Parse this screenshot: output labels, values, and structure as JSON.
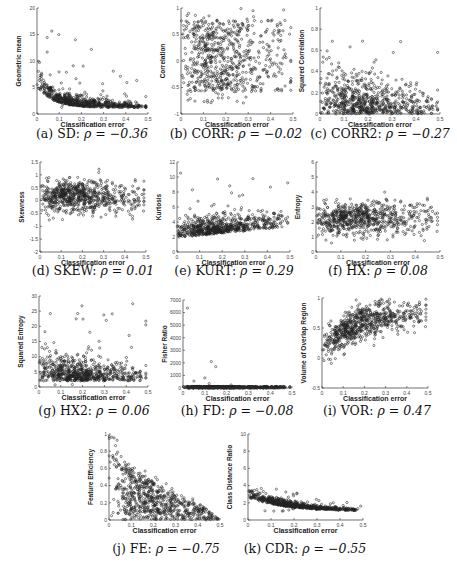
{
  "figure": {
    "panels_count": 11
  },
  "chart_data": [
    {
      "id": "a",
      "type": "scatter",
      "caption_label": "(a) SD:",
      "rho_text": "ρ = −0.36",
      "xlabel": "Classification error",
      "ylabel": "Geometric mean",
      "xlim": [
        0,
        0.5
      ],
      "ylim": [
        0,
        20
      ],
      "xticks": [
        0,
        0.1,
        0.2,
        0.3,
        0.4,
        0.5
      ],
      "xtick_labels": [
        "0",
        "0.1",
        "0.2",
        "0.3",
        "0.4",
        "0.5"
      ],
      "yticks": [
        0,
        5,
        10,
        15,
        20
      ],
      "ytick_labels": [
        "0",
        "5",
        "10",
        "15",
        "20"
      ],
      "pattern": "decay",
      "params": {
        "base": 1.2,
        "amp": 4.0,
        "rate": 14,
        "noise": 1.6,
        "outlier_max": 19
      },
      "box": {
        "left": 37,
        "top": 8,
        "w": 111,
        "h": 106
      },
      "caption_pos": {
        "x": 92,
        "y": 126
      }
    },
    {
      "id": "b",
      "type": "scatter",
      "caption_label": "(b) CORR:",
      "rho_text": "ρ = −0.02",
      "xlabel": "Classification error",
      "ylabel": "Correlation",
      "xlim": [
        0,
        0.5
      ],
      "ylim": [
        -1,
        1
      ],
      "xticks": [
        0,
        0.1,
        0.2,
        0.3,
        0.4,
        0.5
      ],
      "xtick_labels": [
        "0",
        "0.1",
        "0.2",
        "0.3",
        "0.4",
        "0.5"
      ],
      "yticks": [
        -1,
        -0.5,
        0,
        0.5,
        1
      ],
      "ytick_labels": [
        "-1",
        "-0.5",
        "0",
        "0.5",
        "1"
      ],
      "pattern": "uniform_band",
      "params": {
        "center": 0.1,
        "spread": 0.85
      },
      "box": {
        "left": 181,
        "top": 8,
        "w": 112,
        "h": 106
      },
      "caption_pos": {
        "x": 236,
        "y": 126
      }
    },
    {
      "id": "c",
      "type": "scatter",
      "caption_label": "(c) CORR2:",
      "rho_text": "ρ = −0.27",
      "xlabel": "Classification error",
      "ylabel": "Squared Correlation",
      "xlim": [
        0,
        0.5
      ],
      "ylim": [
        0,
        1
      ],
      "xticks": [
        0,
        0.1,
        0.2,
        0.3,
        0.4,
        0.5
      ],
      "xtick_labels": [
        "0",
        "0.1",
        "0.2",
        "0.3",
        "0.4",
        "0.5"
      ],
      "yticks": [
        0,
        0.2,
        0.4,
        0.6,
        0.8,
        1
      ],
      "ytick_labels": [
        "0",
        "0.2",
        "0.4",
        "0.6",
        "0.8",
        "1"
      ],
      "pattern": "floor_skew",
      "params": {
        "scale": 0.22,
        "decay": 1.6,
        "max": 0.85
      },
      "box": {
        "left": 320,
        "top": 8,
        "w": 120,
        "h": 106
      },
      "caption_pos": {
        "x": 380,
        "y": 126
      }
    },
    {
      "id": "d",
      "type": "scatter",
      "caption_label": "(d) SKEW:",
      "rho_text": "ρ = 0.01",
      "xlabel": "Classification error",
      "ylabel": "Skewness",
      "xlim": [
        0,
        0.5
      ],
      "ylim": [
        -2,
        1.5
      ],
      "xticks": [
        0,
        0.1,
        0.2,
        0.3,
        0.4,
        0.5
      ],
      "xtick_labels": [
        "0",
        "0.1",
        "0.2",
        "0.3",
        "0.4",
        "0.5"
      ],
      "yticks": [
        -2,
        -1.5,
        -1,
        -0.5,
        0,
        0.5,
        1,
        1.5
      ],
      "ytick_labels": [
        "-2",
        "-1.5",
        "-1",
        "-0.5",
        "0",
        "0.5",
        "1",
        "1.5"
      ],
      "pattern": "gauss_band",
      "params": {
        "center": 0.15,
        "sd": 0.3
      },
      "box": {
        "left": 40,
        "top": 162,
        "w": 106,
        "h": 90
      },
      "caption_pos": {
        "x": 93,
        "y": 263
      }
    },
    {
      "id": "e",
      "type": "scatter",
      "caption_label": "(e) KURT:",
      "rho_text": "ρ = 0.29",
      "xlabel": "Classification error",
      "ylabel": "Kurtosis",
      "xlim": [
        0,
        0.5
      ],
      "ylim": [
        0,
        12
      ],
      "xticks": [
        0,
        0.1,
        0.2,
        0.3,
        0.4,
        0.5
      ],
      "xtick_labels": [
        "0",
        "0.1",
        "0.2",
        "0.3",
        "0.4",
        "0.5"
      ],
      "yticks": [
        0,
        2,
        4,
        6,
        8,
        10,
        12
      ],
      "ytick_labels": [
        "0",
        "2",
        "4",
        "6",
        "8",
        "10",
        "12"
      ],
      "pattern": "rising_floor",
      "params": {
        "base": 2.2,
        "slope": 3.0,
        "sd": 0.7,
        "outlier_max": 10.7
      },
      "box": {
        "left": 177,
        "top": 162,
        "w": 113,
        "h": 90
      },
      "caption_pos": {
        "x": 234,
        "y": 263
      }
    },
    {
      "id": "f",
      "type": "scatter",
      "caption_label": "(f) HX:",
      "rho_text": "ρ = 0.08",
      "xlabel": "Classification error",
      "ylabel": "Entropy",
      "xlim": [
        0,
        0.5
      ],
      "ylim": [
        0,
        6
      ],
      "xticks": [
        0,
        0.1,
        0.2,
        0.3,
        0.4,
        0.5
      ],
      "xtick_labels": [
        "0",
        "0.1",
        "0.2",
        "0.3",
        "0.4",
        "0.5"
      ],
      "yticks": [
        0,
        1,
        2,
        3,
        4,
        5,
        6
      ],
      "ytick_labels": [
        "0",
        "1",
        "2",
        "3",
        "4",
        "5",
        "6"
      ],
      "pattern": "gauss_band",
      "params": {
        "center": 2.1,
        "sd": 0.55,
        "slope": 0.6
      },
      "box": {
        "left": 316,
        "top": 162,
        "w": 124,
        "h": 90
      },
      "caption_pos": {
        "x": 378,
        "y": 263
      }
    },
    {
      "id": "g",
      "type": "scatter",
      "caption_label": "(g) HX2:",
      "rho_text": "ρ = 0.06",
      "xlabel": "Classification error",
      "ylabel": "Squared Entropy",
      "xlim": [
        0,
        0.5
      ],
      "ylim": [
        0,
        30
      ],
      "xticks": [
        0,
        0.1,
        0.2,
        0.3,
        0.4,
        0.5
      ],
      "xtick_labels": [
        "0",
        "0.1",
        "0.2",
        "0.3",
        "0.4",
        "0.5"
      ],
      "yticks": [
        0,
        5,
        10,
        15,
        20,
        25,
        30
      ],
      "ytick_labels": [
        "0",
        "5",
        "10",
        "15",
        "20",
        "25",
        "30"
      ],
      "pattern": "floor_skew",
      "params": {
        "scale": 4.5,
        "decay": 1.4,
        "max": 30,
        "offset": 2
      },
      "box": {
        "left": 39,
        "top": 296,
        "w": 109,
        "h": 91
      },
      "caption_pos": {
        "x": 94,
        "y": 403
      }
    },
    {
      "id": "h",
      "type": "scatter",
      "caption_label": "(h) FD:",
      "rho_text": "ρ = −0.08",
      "xlabel": "Classification error",
      "ylabel": "Fisher Ratio",
      "xlim": [
        0,
        0.5
      ],
      "ylim": [
        0,
        7000
      ],
      "xticks": [
        0,
        0.1,
        0.2,
        0.3,
        0.4,
        0.5
      ],
      "xtick_labels": [
        "0",
        "0.1",
        "0.2",
        "0.3",
        "0.4",
        "0.5"
      ],
      "yticks": [
        0,
        1000,
        2000,
        3000,
        4000,
        5000,
        6000,
        7000
      ],
      "ytick_labels": [
        "0",
        "1000",
        "2000",
        "3000",
        "4000",
        "5000",
        "6000",
        "7000"
      ],
      "pattern": "flat_outliers",
      "params": {
        "outliers": [
          [
            0.02,
            6350
          ],
          [
            0.13,
            2100
          ],
          [
            0.15,
            1700
          ],
          [
            0.1,
            800
          ],
          [
            0.05,
            550
          ],
          [
            0.12,
            350
          ],
          [
            0.22,
            250
          ]
        ]
      },
      "box": {
        "left": 183,
        "top": 300,
        "w": 109,
        "h": 88
      },
      "caption_pos": {
        "x": 237,
        "y": 403
      }
    },
    {
      "id": "i",
      "type": "scatter",
      "caption_label": "(i) VOR:",
      "rho_text": "ρ = 0.47",
      "xlabel": "Classification error",
      "ylabel": "Volume of Overlap Region",
      "xlim": [
        0,
        0.5
      ],
      "ylim": [
        -0.5,
        1
      ],
      "xticks": [
        0,
        0.1,
        0.2,
        0.3,
        0.4,
        0.5
      ],
      "xtick_labels": [
        "0",
        "0.1",
        "0.2",
        "0.3",
        "0.4",
        "0.5"
      ],
      "yticks": [
        -0.5,
        0,
        0.5,
        1
      ],
      "ytick_labels": [
        "-0.5",
        "0",
        "0.5",
        "1"
      ],
      "pattern": "saturating",
      "params": {
        "base": 0.15,
        "amp": 0.65,
        "rate": 6,
        "sd": 0.13
      },
      "box": {
        "left": 322,
        "top": 298,
        "w": 106,
        "h": 90
      },
      "caption_pos": {
        "x": 377,
        "y": 403
      }
    },
    {
      "id": "j",
      "type": "scatter",
      "caption_label": "(j) FE:",
      "rho_text": "ρ = −0.75",
      "xlabel": "Classification error",
      "ylabel": "Feature Efficiency",
      "xlim": [
        0,
        0.5
      ],
      "ylim": [
        0,
        1
      ],
      "xticks": [
        0,
        0.1,
        0.2,
        0.3,
        0.4,
        0.5
      ],
      "xtick_labels": [
        "0",
        "0.1",
        "0.2",
        "0.3",
        "0.4",
        "0.5"
      ],
      "yticks": [
        0,
        0.2,
        0.4,
        0.6,
        0.8,
        1
      ],
      "ytick_labels": [
        "0",
        "0.2",
        "0.4",
        "0.6",
        "0.8",
        "1"
      ],
      "pattern": "triangle_decay",
      "params": {
        "top": 1.0
      },
      "box": {
        "left": 109,
        "top": 434,
        "w": 111,
        "h": 86
      },
      "caption_pos": {
        "x": 166,
        "y": 541
      }
    },
    {
      "id": "k",
      "type": "scatter",
      "caption_label": "(k) CDR:",
      "rho_text": "ρ = −0.55",
      "xlabel": "Classification error",
      "ylabel": "Class Distance Ratio",
      "xlim": [
        0,
        0.5
      ],
      "ylim": [
        0,
        10
      ],
      "xticks": [
        0,
        0.1,
        0.2,
        0.3,
        0.4,
        0.5
      ],
      "xtick_labels": [
        "0",
        "0.1",
        "0.2",
        "0.3",
        "0.4",
        "0.5"
      ],
      "yticks": [
        0,
        2,
        4,
        6,
        8,
        10
      ],
      "ytick_labels": [
        "0",
        "2",
        "4",
        "6",
        "8",
        "10"
      ],
      "pattern": "decay",
      "params": {
        "base": 1.0,
        "amp": 1.6,
        "rate": 6,
        "noise": 0.55,
        "outlier_max": 4.2
      },
      "box": {
        "left": 248,
        "top": 434,
        "w": 115,
        "h": 86
      },
      "caption_pos": {
        "x": 305,
        "y": 541
      }
    }
  ]
}
